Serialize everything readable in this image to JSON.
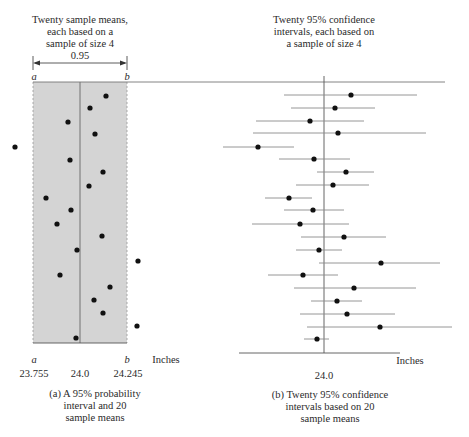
{
  "panel_a": {
    "title": "Twenty sample means,\neach based on a\nsample of size 4",
    "interval_label": "0.95",
    "a_label": "a",
    "b_label": "b",
    "axis_unit": "Inches",
    "tick_labels": [
      "23.755",
      "24.0",
      "24.245"
    ],
    "caption": "(a)  A 95% probability\ninterval and 20\nsample means"
  },
  "panel_b": {
    "title": "Twenty 95% confidence\nintervals, each based on\na sample of size 4",
    "axis_unit": "Inches",
    "tick_labels": [
      "24.0"
    ],
    "caption": "(b)  Twenty 95% confidence\nintervals based on 20\nsample means"
  },
  "colors": {
    "shade": "#d4d4d4",
    "ink": "#111111",
    "line": "#8a8a8a"
  },
  "chart_data": [
    {
      "type": "scatter",
      "title": "Twenty sample means, each based on a sample of size 4",
      "xlabel": "Inches",
      "x_ticks": [
        23.755,
        24.0,
        24.245
      ],
      "probability_interval": {
        "a": 23.755,
        "b": 24.245,
        "probability": 0.95
      },
      "points_px": [
        {
          "x": 106,
          "y": 96
        },
        {
          "x": 90,
          "y": 108
        },
        {
          "x": 68,
          "y": 122
        },
        {
          "x": 95,
          "y": 134
        },
        {
          "x": 15,
          "y": 147
        },
        {
          "x": 70,
          "y": 160
        },
        {
          "x": 103,
          "y": 172
        },
        {
          "x": 89,
          "y": 186
        },
        {
          "x": 46,
          "y": 198
        },
        {
          "x": 71,
          "y": 210
        },
        {
          "x": 57,
          "y": 224
        },
        {
          "x": 102,
          "y": 236
        },
        {
          "x": 77,
          "y": 250
        },
        {
          "x": 138,
          "y": 261
        },
        {
          "x": 60,
          "y": 275
        },
        {
          "x": 110,
          "y": 287
        },
        {
          "x": 94,
          "y": 300
        },
        {
          "x": 103,
          "y": 313
        },
        {
          "x": 137,
          "y": 326
        },
        {
          "x": 76,
          "y": 338
        }
      ],
      "sample_means_estimated": [
        24.14,
        24.05,
        23.94,
        24.08,
        23.66,
        23.95,
        24.12,
        24.05,
        23.83,
        23.96,
        23.89,
        24.11,
        23.98,
        24.3,
        23.9,
        24.16,
        24.07,
        24.12,
        24.29,
        23.98
      ]
    },
    {
      "type": "scatter",
      "title": "Twenty 95% confidence intervals, each based on a sample of size 4",
      "xlabel": "Inches",
      "x_ticks": [
        24.0
      ],
      "intervals_px": [
        {
          "y": 95,
          "mean": 351,
          "lo": 284,
          "hi": 417
        },
        {
          "y": 108,
          "mean": 335,
          "lo": 291,
          "hi": 375
        },
        {
          "y": 121,
          "mean": 310,
          "lo": 256,
          "hi": 364
        },
        {
          "y": 133,
          "mean": 338,
          "lo": 253,
          "hi": 426
        },
        {
          "y": 147,
          "mean": 258,
          "lo": 223,
          "hi": 294
        },
        {
          "y": 159,
          "mean": 314,
          "lo": 279,
          "hi": 350
        },
        {
          "y": 172,
          "mean": 346,
          "lo": 317,
          "hi": 374
        },
        {
          "y": 185,
          "mean": 333,
          "lo": 296,
          "hi": 369
        },
        {
          "y": 198,
          "mean": 289,
          "lo": 265,
          "hi": 312
        },
        {
          "y": 210,
          "mean": 313,
          "lo": 284,
          "hi": 344
        },
        {
          "y": 224,
          "mean": 300,
          "lo": 252,
          "hi": 349
        },
        {
          "y": 237,
          "mean": 344,
          "lo": 301,
          "hi": 386
        },
        {
          "y": 250,
          "mean": 319,
          "lo": 296,
          "hi": 342
        },
        {
          "y": 263,
          "mean": 381,
          "lo": 319,
          "hi": 440
        },
        {
          "y": 275,
          "mean": 303,
          "lo": 268,
          "hi": 338
        },
        {
          "y": 288,
          "mean": 354,
          "lo": 294,
          "hi": 416
        },
        {
          "y": 301,
          "mean": 337,
          "lo": 311,
          "hi": 362
        },
        {
          "y": 314,
          "mean": 347,
          "lo": 300,
          "hi": 395
        },
        {
          "y": 327,
          "mean": 380,
          "lo": 307,
          "hi": 452
        },
        {
          "y": 339,
          "mean": 317,
          "lo": 304,
          "hi": 329
        }
      ]
    }
  ]
}
